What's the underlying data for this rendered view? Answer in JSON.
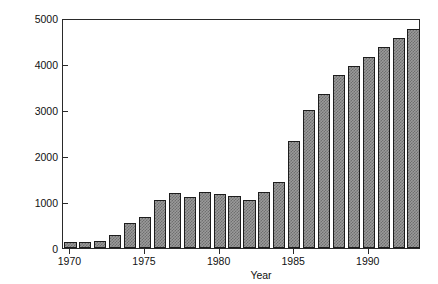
{
  "chart_data": {
    "type": "bar",
    "title": "",
    "xlabel": "Year",
    "ylabel": "Area treated (ha)",
    "categories": [
      "1970",
      "1971",
      "1972",
      "1973",
      "1974",
      "1975",
      "1976",
      "1977",
      "1978",
      "1979",
      "1980",
      "1981",
      "1982",
      "1983",
      "1984",
      "1985",
      "1986",
      "1987",
      "1988",
      "1989",
      "1990",
      "1991",
      "1992",
      "1993"
    ],
    "values": [
      120,
      120,
      150,
      280,
      550,
      680,
      1050,
      1200,
      1110,
      1210,
      1170,
      1140,
      1040,
      1220,
      1440,
      2330,
      3010,
      3350,
      3770,
      3960,
      4160,
      4360,
      4560,
      4760
    ],
    "ylim": [
      0,
      5000
    ],
    "ytick_values": [
      0,
      1000,
      2000,
      3000,
      4000,
      5000
    ],
    "ytick_labels": [
      "0",
      "1000",
      "2000",
      "3000",
      "4000",
      "5000"
    ],
    "xtick_labels": [
      "1970",
      "1975",
      "1980",
      "1985",
      "1990"
    ],
    "xtick_categories": [
      "1970",
      "1975",
      "1980",
      "1985",
      "1990"
    ],
    "grid": false,
    "legend": false,
    "bar_color": "#9a9a9a",
    "bar_edge_color": "#1d1d1d",
    "axis_color": "#2a2a2a",
    "background_color": "#ffffff"
  }
}
